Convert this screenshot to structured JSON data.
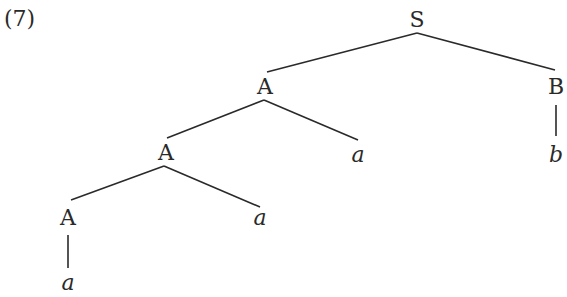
{
  "example_number": "(7)",
  "tree": {
    "nodes": [
      {
        "id": "S",
        "label": "S",
        "type": "nonterminal",
        "x": 417,
        "y": 20
      },
      {
        "id": "A1",
        "label": "A",
        "type": "nonterminal",
        "x": 265,
        "y": 87
      },
      {
        "id": "B",
        "label": "B",
        "type": "nonterminal",
        "x": 556,
        "y": 87
      },
      {
        "id": "A2",
        "label": "A",
        "type": "nonterminal",
        "x": 166,
        "y": 153
      },
      {
        "id": "a1",
        "label": "a",
        "type": "terminal",
        "x": 358,
        "y": 155
      },
      {
        "id": "b",
        "label": "b",
        "type": "terminal",
        "x": 556,
        "y": 155
      },
      {
        "id": "A3",
        "label": "A",
        "type": "nonterminal",
        "x": 68,
        "y": 218
      },
      {
        "id": "a2",
        "label": "a",
        "type": "terminal",
        "x": 260,
        "y": 218
      },
      {
        "id": "a3",
        "label": "a",
        "type": "terminal",
        "x": 68,
        "y": 283
      }
    ],
    "edges": [
      {
        "from": "S",
        "to": "A1",
        "x1": 417,
        "y1": 33,
        "x2": 267,
        "y2": 72
      },
      {
        "from": "S",
        "to": "B",
        "x1": 417,
        "y1": 33,
        "x2": 555,
        "y2": 70
      },
      {
        "from": "A1",
        "to": "A2",
        "x1": 264,
        "y1": 100,
        "x2": 167,
        "y2": 138
      },
      {
        "from": "A1",
        "to": "a1",
        "x1": 264,
        "y1": 100,
        "x2": 358,
        "y2": 140
      },
      {
        "from": "B",
        "to": "b",
        "x1": 556,
        "y1": 105,
        "x2": 556,
        "y2": 136
      },
      {
        "from": "A2",
        "to": "A3",
        "x1": 164,
        "y1": 166,
        "x2": 71,
        "y2": 200
      },
      {
        "from": "A2",
        "to": "a2",
        "x1": 164,
        "y1": 166,
        "x2": 260,
        "y2": 207
      },
      {
        "from": "A3",
        "to": "a3",
        "x1": 68,
        "y1": 235,
        "x2": 68,
        "y2": 268
      }
    ]
  }
}
